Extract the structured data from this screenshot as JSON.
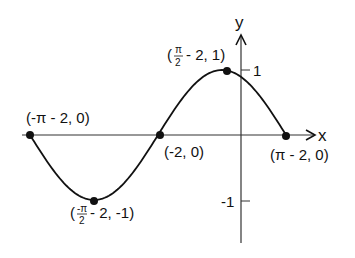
{
  "colors": {
    "ink": "#111111",
    "axis": "#333333",
    "background": "#ffffff"
  },
  "axes": {
    "x_label": "x",
    "y_label": "y",
    "y_ticks": [
      {
        "value": 1,
        "label": "1"
      },
      {
        "value": -1,
        "label": "-1"
      }
    ]
  },
  "points": [
    {
      "label": "(-π - 2, 0)",
      "x": "-π - 2",
      "y": 0
    },
    {
      "label_open": "(",
      "label_frac_num": "-π",
      "label_frac_den": "2",
      "label_rest": "- 2, -1)",
      "x": "-π/2 - 2",
      "y": -1
    },
    {
      "label": "(-2, 0)",
      "x": "-2",
      "y": 0
    },
    {
      "label_open": "(",
      "label_frac_num": "π",
      "label_frac_den": "2",
      "label_rest": "- 2, 1)",
      "x": "π/2 - 2",
      "y": 1
    },
    {
      "label": "(π - 2, 0)",
      "x": "π - 2",
      "y": 0
    }
  ],
  "chart_data": {
    "type": "line",
    "title": "",
    "function": "y = sin(x + 2)",
    "xlabel": "x",
    "ylabel": "y",
    "x": [
      -5.1416,
      -3.5708,
      -2,
      -0.4292,
      1.1416
    ],
    "y": [
      0,
      -1,
      0,
      1,
      0
    ],
    "labeled_points": [
      "(-π - 2, 0)",
      "(-π/2 - 2, -1)",
      "(-2, 0)",
      "(π/2 - 2, 1)",
      "(π - 2, 0)"
    ],
    "y_ticks": [
      -1,
      1
    ],
    "xlim": [
      -5.3,
      1.8
    ],
    "ylim": [
      -1.7,
      1.5
    ],
    "grid": false
  }
}
